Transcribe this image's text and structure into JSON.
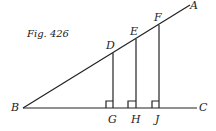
{
  "figure": {
    "caption": "Fig. 426",
    "points": {
      "A": "A",
      "B": "B",
      "C": "C",
      "D": "D",
      "E": "E",
      "F": "F",
      "G": "G",
      "H": "H",
      "J": "J"
    },
    "line_color": "#222222"
  }
}
